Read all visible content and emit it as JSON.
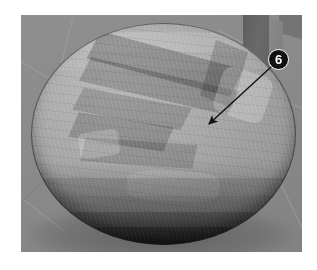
{
  "figure": {
    "scene_description": "Grayscale shaded 3D viewport showing a tessellated hemispherical dome resting on a tiled ground plane, with a rectangular pillar in the upper right background.",
    "background_color": "#ffffff",
    "viewport": {
      "background_color": "#8d8d8d",
      "x": 21,
      "y": 15,
      "width": 281,
      "height": 237
    },
    "dome": {
      "name": "faceted-dome",
      "surface_color": "#a2a2a2",
      "highlight_color": "#bcbcbc",
      "shadow_color": "#4a4a4a",
      "rim_color": "#1a1a1a",
      "outline_color": "#303030"
    },
    "pillar": {
      "name": "background-pillar",
      "face_color": "#5e5e5e",
      "side_color": "#848484"
    },
    "floor": {
      "name": "ground-plane",
      "color": "#8a8a8a",
      "grid_line_color": "#9d9d9d"
    },
    "callout": {
      "label": "6",
      "badge_fill": "#111111",
      "badge_text_color": "#ffffff",
      "badge_center_x": 278,
      "badge_center_y": 59,
      "arrow_color": "#151515",
      "arrow_start_x": 271,
      "arrow_start_y": 68,
      "arrow_tip_x": 206,
      "arrow_tip_y": 127,
      "target_description": "darker shaded band region on the dome surface"
    }
  }
}
